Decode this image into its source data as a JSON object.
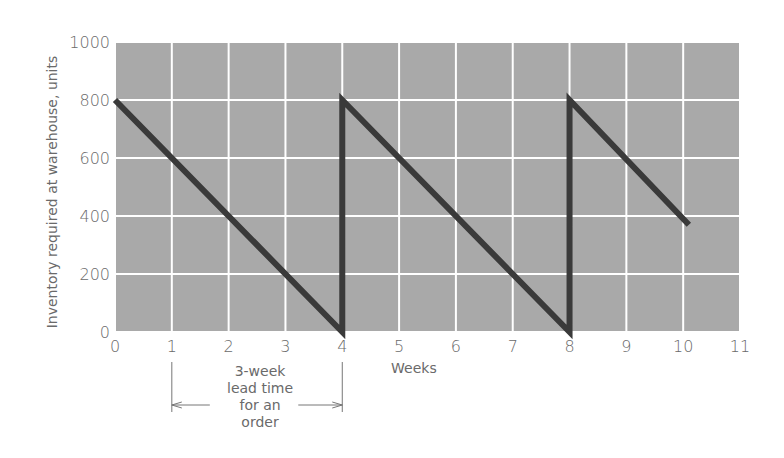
{
  "chart_data": {
    "type": "line",
    "title": "",
    "xlabel": "Weeks",
    "ylabel": "Inventory required at warehouse, units",
    "xlim": [
      0,
      11
    ],
    "ylim": [
      0,
      1000
    ],
    "x_ticks": [
      "0",
      "1",
      "2",
      "3",
      "4",
      "5",
      "6",
      "7",
      "8",
      "9",
      "10",
      "11"
    ],
    "y_ticks": [
      "0",
      "200",
      "400",
      "600",
      "800",
      "1000"
    ],
    "grid": true,
    "legend": null,
    "series": [
      {
        "name": "Inventory",
        "x": [
          0,
          4,
          4,
          8,
          8,
          10.1
        ],
        "y": [
          800,
          0,
          800,
          0,
          800,
          370
        ]
      }
    ],
    "annotations": [
      {
        "text": [
          "3-week",
          "lead time",
          "for an",
          "order"
        ],
        "type": "double-arrow",
        "from_x": 1,
        "to_x": 4
      }
    ],
    "colors": {
      "plot_bg": "#a9a9a9",
      "grid": "#ffffff",
      "line": "#3a3a3a"
    }
  }
}
